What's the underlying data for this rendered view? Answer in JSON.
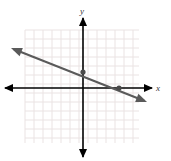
{
  "figure": {
    "width": 171,
    "height": 161,
    "background_color": "#ffffff",
    "clipped_caption": ""
  },
  "axes": {
    "x_label": "x",
    "y_label": "y",
    "axis_color": "#000000",
    "x_axis_pixel_y": 88,
    "y_axis_pixel_x": 83,
    "x_axis_start_px": 5,
    "x_axis_end_px": 152,
    "y_axis_start_px": 18,
    "y_axis_end_px": 157,
    "x_label_pos": [
      158,
      90
    ],
    "y_label_pos": [
      84,
      14
    ]
  },
  "grid": {
    "color": "#eae3e3",
    "cell_px": 9,
    "left_px": 25,
    "top_px": 30,
    "right_px": 139,
    "bottom_px": 143,
    "columns": 13,
    "rows": 13,
    "show": true
  },
  "chart_data": {
    "type": "line",
    "title": "",
    "xlabel": "x",
    "ylabel": "y",
    "grid": true,
    "legend": "none",
    "xlim": [
      -7,
      6
    ],
    "ylim": [
      -6,
      7
    ],
    "tick_labels_shown": false,
    "series": [
      {
        "name": "line",
        "color": "#5a5a5a",
        "style": "double-headed arrow",
        "slope": -0.4,
        "intercept": 2,
        "equation": "y = -2/5 x + 2",
        "endpoints_px": [
          [
            11,
            48
          ],
          [
            147,
            102
          ]
        ],
        "x": [
          -8,
          7.1
        ],
        "y": [
          5.2,
          -0.84
        ]
      }
    ],
    "points": [
      {
        "name": "y-intercept",
        "x": 0,
        "y": 2,
        "pixel": [
          83,
          72
        ],
        "color": "#4a4a4a"
      },
      {
        "name": "x-intercept",
        "x": 4,
        "y": 0,
        "pixel": [
          119,
          88
        ],
        "color": "#4a4a4a"
      }
    ]
  }
}
